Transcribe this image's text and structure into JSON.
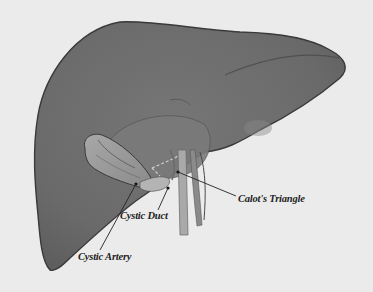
{
  "figure": {
    "colors": {
      "background": "#ebebeb",
      "liver": "#6e6e6e",
      "liver_edge": "#3c3c3c",
      "gallbladder": "#9a9a9a",
      "ducts": "#a6a6a6",
      "label_text": "#1e1e1e"
    },
    "labels": [
      {
        "id": "cystic-duct",
        "text": "Cystic Duct",
        "x": 120,
        "y": 214
      },
      {
        "id": "calots-triangle",
        "text": "Calot's Triangle",
        "x": 238,
        "y": 197
      },
      {
        "id": "cystic-artery",
        "text": "Cystic Artery",
        "x": 78,
        "y": 254
      }
    ]
  }
}
